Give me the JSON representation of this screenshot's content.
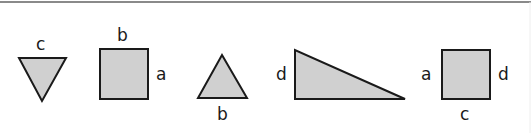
{
  "diagram": {
    "colors": {
      "fill": "#d0d0d0",
      "stroke": "#1a1a1a",
      "top_rule": "#8a8a8a",
      "background": "#ffffff"
    },
    "shapes": [
      {
        "id": "inverted-triangle",
        "type": "triangle",
        "orientation": "point-down",
        "labels": [
          {
            "text": "c",
            "side": "top"
          }
        ]
      },
      {
        "id": "square-1",
        "type": "square",
        "labels": [
          {
            "text": "b",
            "side": "top"
          },
          {
            "text": "a",
            "side": "right"
          }
        ]
      },
      {
        "id": "upright-triangle",
        "type": "triangle",
        "orientation": "point-up",
        "labels": [
          {
            "text": "b",
            "side": "bottom"
          }
        ]
      },
      {
        "id": "right-triangle",
        "type": "right-triangle",
        "labels": [
          {
            "text": "d",
            "side": "left"
          }
        ]
      },
      {
        "id": "square-2",
        "type": "square",
        "labels": [
          {
            "text": "a",
            "side": "left"
          },
          {
            "text": "d",
            "side": "right"
          },
          {
            "text": "c",
            "side": "bottom"
          }
        ]
      }
    ],
    "labels": {
      "tri1_top": "c",
      "sq1_top": "b",
      "sq1_right": "a",
      "tri2_bottom": "b",
      "rt_left": "d",
      "sq2_left": "a",
      "sq2_right": "d",
      "sq2_bottom": "c"
    }
  }
}
